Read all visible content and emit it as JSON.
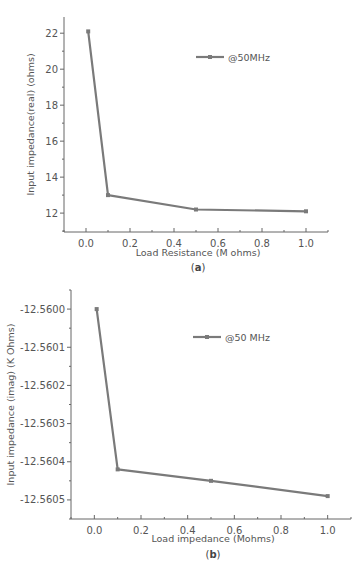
{
  "chart_data": [
    {
      "id": "a",
      "type": "line",
      "caption": "(a)",
      "caption_letter": "a",
      "title": "",
      "xlabel": "Load Resistance (M ohms)",
      "ylabel": "Input impedance(real) (ohms)",
      "xlim": [
        -0.1,
        1.1
      ],
      "ylim": [
        10.95,
        22.9
      ],
      "xticks": [
        0.0,
        0.2,
        0.4,
        0.6,
        0.8,
        1.0
      ],
      "xtick_labels": [
        "0.0",
        "0.2",
        "0.4",
        "0.6",
        "0.8",
        "1.0"
      ],
      "yticks": [
        12,
        14,
        16,
        18,
        20,
        22
      ],
      "ytick_labels": [
        "12",
        "14",
        "16",
        "18",
        "20",
        "22"
      ],
      "grid": false,
      "legend_position": "upper right",
      "series": [
        {
          "name": "@50MHz",
          "color": "#7a7a7a",
          "marker": "square",
          "x": [
            0.01,
            0.1,
            0.5,
            1.0
          ],
          "y": [
            22.1,
            13.0,
            12.2,
            12.1
          ]
        }
      ]
    },
    {
      "id": "b",
      "type": "line",
      "caption": "(b)",
      "caption_letter": "b",
      "title": "",
      "xlabel": "Load impedance (Mohms)",
      "ylabel": "Input impedance (imag) (K Ohms)",
      "xlim": [
        -0.1,
        1.1
      ],
      "ylim": [
        -12.56055,
        -12.55995
      ],
      "xticks": [
        0.0,
        0.2,
        0.4,
        0.6,
        0.8,
        1.0
      ],
      "xtick_labels": [
        "0.0",
        "0.2",
        "0.4",
        "0.6",
        "0.8",
        "1.0"
      ],
      "yticks": [
        -12.56,
        -12.5601,
        -12.5602,
        -12.5603,
        -12.5604,
        -12.5605
      ],
      "ytick_labels": [
        "-12.5600",
        "-12.5601",
        "-12.5602",
        "-12.5603",
        "-12.5604",
        "-12.5605"
      ],
      "grid": false,
      "legend_position": "upper right",
      "series": [
        {
          "name": "@50 MHz",
          "color": "#7a7a7a",
          "marker": "square",
          "x": [
            0.01,
            0.1,
            0.5,
            1.0
          ],
          "y": [
            -12.56,
            -12.56042,
            -12.56045,
            -12.56049
          ]
        }
      ]
    }
  ]
}
